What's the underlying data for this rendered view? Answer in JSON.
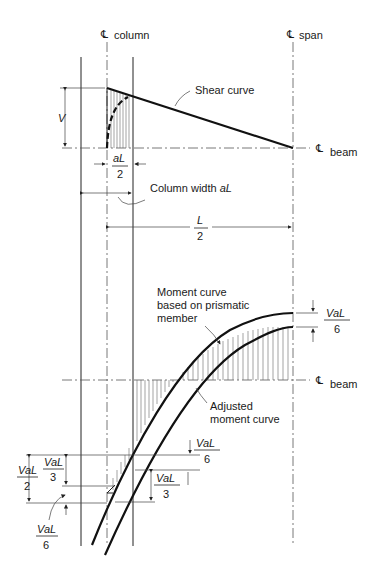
{
  "labels": {
    "cl_symbol": "℄",
    "cl_column": "column",
    "cl_span": "span",
    "cl_beam_top": "beam",
    "cl_beam_bottom": "beam",
    "shear_curve": "Shear curve",
    "V": "V",
    "aL": "aL",
    "two": "2",
    "column_width": "Column width ",
    "column_width_var": "aL",
    "L": "L",
    "moment_curve_1": "Moment curve",
    "moment_curve_2": "based on prismatic",
    "moment_curve_3": "member",
    "adjusted_1": "Adjusted",
    "adjusted_2": "moment curve",
    "VaL": "VaL",
    "six": "6",
    "three": "3"
  },
  "colors": {
    "line": "#111111",
    "background": "#ffffff"
  }
}
